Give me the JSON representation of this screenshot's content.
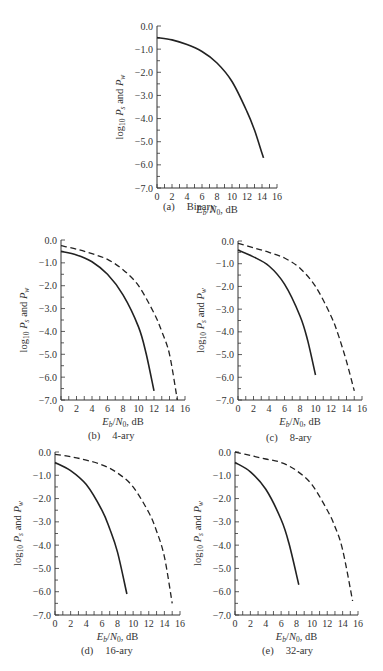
{
  "figure": {
    "panels": [
      {
        "id": "a",
        "letter": "(a)",
        "label": "Binary",
        "box": {
          "x0": 157,
          "y0": 26,
          "x1": 277,
          "y1": 188
        },
        "caption_pos": {
          "left": 163,
          "top": 201
        }
      },
      {
        "id": "b",
        "letter": "(b)",
        "label": "4-ary",
        "box": {
          "x0": 61,
          "y0": 240,
          "x1": 185,
          "y1": 400
        },
        "caption_pos": {
          "left": 88,
          "top": 430
        }
      },
      {
        "id": "c",
        "letter": "(c)",
        "label": "8-ary",
        "box": {
          "x0": 238,
          "y0": 241,
          "x1": 362,
          "y1": 400
        },
        "caption_pos": {
          "left": 266,
          "top": 432
        }
      },
      {
        "id": "d",
        "letter": "(d)",
        "label": "16-ary",
        "box": {
          "x0": 55,
          "y0": 452,
          "x1": 180,
          "y1": 615
        },
        "caption_pos": {
          "left": 81,
          "top": 645
        }
      },
      {
        "id": "e",
        "letter": "(e)",
        "label": "32-ary",
        "box": {
          "x0": 235,
          "y0": 452,
          "x1": 358,
          "y1": 615
        },
        "caption_pos": {
          "left": 262,
          "top": 645
        }
      }
    ]
  },
  "chart_data": [
    {
      "type": "line",
      "title": "(a) Binary",
      "xlabel": "Eb/N0, dB",
      "ylabel": "log10 Ps and Pw",
      "xlim": [
        0,
        16
      ],
      "ylim": [
        -7.0,
        0.0
      ],
      "xticks": [
        "0",
        "2",
        "4",
        "6",
        "8",
        "10",
        "12",
        "14",
        "16"
      ],
      "yticks": [
        "0.0",
        "-1.0",
        "-2.0",
        "-3.0",
        "-4.0",
        "-5.0",
        "-6.0",
        "-7.0"
      ],
      "grid": false,
      "series": [
        {
          "name": "Ps = Pw",
          "style": "solid",
          "x": [
            0,
            2,
            4,
            6,
            8,
            10,
            12,
            13,
            14,
            14.2
          ],
          "y": [
            -0.5,
            -0.6,
            -0.8,
            -1.1,
            -1.6,
            -2.4,
            -3.7,
            -4.5,
            -5.5,
            -5.7
          ]
        }
      ]
    },
    {
      "type": "line",
      "title": "(b) 4-ary",
      "xlabel": "Eb/N0, dB",
      "ylabel": "log10 Ps and Pw",
      "xlim": [
        0,
        16
      ],
      "ylim": [
        -7.0,
        0.0
      ],
      "xticks": [
        "0",
        "2",
        "4",
        "6",
        "8",
        "10",
        "12",
        "14",
        "16"
      ],
      "yticks": [
        "0.0",
        "-1.0",
        "-2.0",
        "-3.0",
        "-4.0",
        "-5.0",
        "-6.0",
        "-7.0"
      ],
      "grid": false,
      "series": [
        {
          "name": "Pw (bit error)",
          "style": "solid",
          "x": [
            0,
            2,
            4,
            6,
            8,
            10,
            11,
            12
          ],
          "y": [
            -0.5,
            -0.65,
            -0.95,
            -1.5,
            -2.4,
            -3.8,
            -5.0,
            -6.6
          ]
        },
        {
          "name": "Ps (symbol error)",
          "style": "dashed",
          "x": [
            0,
            2,
            4,
            6,
            8,
            10,
            12,
            13,
            14,
            15
          ],
          "y": [
            -0.25,
            -0.4,
            -0.6,
            -0.85,
            -1.3,
            -2.0,
            -3.2,
            -4.0,
            -5.0,
            -7.0
          ]
        }
      ]
    },
    {
      "type": "line",
      "title": "(c) 8-ary",
      "xlabel": "Eb/N0, dB",
      "ylabel": "log10 Ps and Pw",
      "xlim": [
        0,
        16
      ],
      "ylim": [
        -7.0,
        0.0
      ],
      "xticks": [
        "0",
        "2",
        "4",
        "6",
        "8",
        "10",
        "12",
        "14",
        "16"
      ],
      "yticks": [
        "0.0",
        "-1.0",
        "-2.0",
        "-3.0",
        "-4.0",
        "-5.0",
        "-6.0",
        "-7.0"
      ],
      "grid": false,
      "series": [
        {
          "name": "Pw (bit error)",
          "style": "solid",
          "x": [
            0,
            2,
            4,
            6,
            8,
            9,
            10
          ],
          "y": [
            -0.4,
            -0.7,
            -1.1,
            -1.9,
            -3.3,
            -4.4,
            -5.9
          ]
        },
        {
          "name": "Ps (symbol error)",
          "style": "dashed",
          "x": [
            0,
            2,
            4,
            6,
            8,
            10,
            12,
            13,
            14,
            15
          ],
          "y": [
            -0.1,
            -0.3,
            -0.5,
            -0.75,
            -1.2,
            -2.0,
            -3.3,
            -4.2,
            -5.3,
            -6.6
          ]
        }
      ]
    },
    {
      "type": "line",
      "title": "(d) 16-ary",
      "xlabel": "Eb/N0, dB",
      "ylabel": "log10 Ps and Pw",
      "xlim": [
        0,
        16
      ],
      "ylim": [
        -7.0,
        0.0
      ],
      "xticks": [
        "0",
        "2",
        "4",
        "6",
        "8",
        "10",
        "12",
        "14",
        "16"
      ],
      "yticks": [
        "0.0",
        "-1.0",
        "-2.0",
        "-3.0",
        "-4.0",
        "-5.0",
        "-6.0",
        "-7.0"
      ],
      "grid": false,
      "series": [
        {
          "name": "Pw (bit error)",
          "style": "solid",
          "x": [
            0,
            2,
            4,
            6,
            7,
            8,
            9.2
          ],
          "y": [
            -0.45,
            -0.8,
            -1.4,
            -2.5,
            -3.3,
            -4.3,
            -6.1
          ]
        },
        {
          "name": "Ps (symbol error)",
          "style": "dashed",
          "x": [
            0,
            2,
            4,
            6,
            8,
            10,
            12,
            13,
            14,
            15
          ],
          "y": [
            -0.1,
            -0.2,
            -0.35,
            -0.55,
            -0.9,
            -1.5,
            -2.6,
            -3.4,
            -4.5,
            -6.5
          ]
        }
      ]
    },
    {
      "type": "line",
      "title": "(e) 32-ary",
      "xlabel": "Eb/N0, dB",
      "ylabel": "log10 Ps and Pw",
      "xlim": [
        0,
        16
      ],
      "ylim": [
        -7.0,
        0.0
      ],
      "xticks": [
        "0",
        "2",
        "4",
        "6",
        "8",
        "10",
        "12",
        "14",
        "16"
      ],
      "yticks": [
        "0.0",
        "-1.0",
        "-2.0",
        "-3.0",
        "-4.0",
        "-5.0",
        "-6.0",
        "-7.0"
      ],
      "grid": false,
      "series": [
        {
          "name": "Pw (bit error)",
          "style": "solid",
          "x": [
            0,
            2,
            4,
            6,
            7,
            8.3
          ],
          "y": [
            -0.45,
            -0.85,
            -1.6,
            -2.9,
            -3.9,
            -5.7
          ]
        },
        {
          "name": "Ps (symbol error)",
          "style": "dashed",
          "x": [
            0,
            2,
            4,
            6,
            8,
            10,
            12,
            13,
            14,
            15.3
          ],
          "y": [
            0.0,
            -0.15,
            -0.3,
            -0.45,
            -0.8,
            -1.4,
            -2.5,
            -3.2,
            -4.2,
            -6.4
          ]
        }
      ]
    }
  ]
}
